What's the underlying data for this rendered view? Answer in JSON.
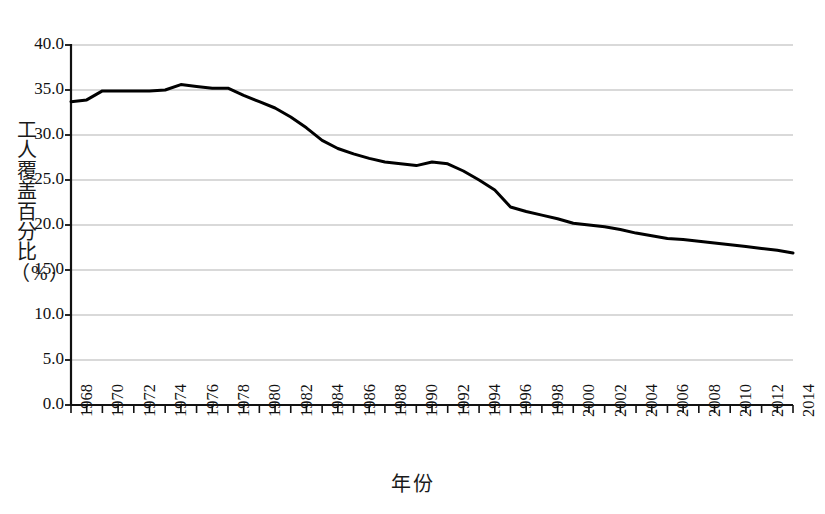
{
  "chart_data": {
    "type": "line",
    "title": "",
    "subtitle": "",
    "xlabel": "年份",
    "ylabel": "工人覆盖百分比（%）",
    "xlim": [
      1968,
      2014
    ],
    "ylim": [
      0.0,
      40.0
    ],
    "grid": true,
    "grid_axis": "y",
    "legend": false,
    "legend_position": "none",
    "line_color": "#000000",
    "line_width": 3,
    "x_tick_step": 2,
    "x_minor_tick_step": 1,
    "y_tick_step": 5,
    "y_tick_labels": [
      "40.0",
      "35.0",
      "30.0",
      "25.0",
      "20.0",
      "15.0",
      "10.0",
      "5.0",
      "0.0"
    ],
    "y_tick_values": [
      40.0,
      35.0,
      30.0,
      25.0,
      20.0,
      15.0,
      10.0,
      5.0,
      0.0
    ],
    "x_tick_labels": [
      "1968",
      "1970",
      "1972",
      "1974",
      "1976",
      "1978",
      "1980",
      "1982",
      "1984",
      "1986",
      "1988",
      "1990",
      "1992",
      "1994",
      "1996",
      "1998",
      "2000",
      "2002",
      "2004",
      "2006",
      "2008",
      "2010",
      "2012",
      "2014"
    ],
    "x_tick_values": [
      1968,
      1970,
      1972,
      1974,
      1976,
      1978,
      1980,
      1982,
      1984,
      1986,
      1988,
      1990,
      1992,
      1994,
      1996,
      1998,
      2000,
      2002,
      2004,
      2006,
      2008,
      2010,
      2012,
      2014
    ],
    "x": [
      1968,
      1969,
      1970,
      1971,
      1972,
      1973,
      1974,
      1975,
      1976,
      1977,
      1978,
      1979,
      1980,
      1981,
      1982,
      1983,
      1984,
      1985,
      1986,
      1987,
      1988,
      1989,
      1990,
      1991,
      1992,
      1993,
      1994,
      1995,
      1996,
      1997,
      1998,
      1999,
      2000,
      2001,
      2002,
      2003,
      2004,
      2005,
      2006,
      2007,
      2008,
      2009,
      2010,
      2011,
      2012,
      2013,
      2014
    ],
    "values": [
      33.7,
      33.9,
      34.9,
      34.9,
      34.9,
      34.9,
      35.0,
      35.6,
      35.4,
      35.2,
      35.2,
      34.4,
      33.7,
      33.0,
      32.0,
      30.8,
      29.4,
      28.5,
      27.9,
      27.4,
      27.0,
      26.8,
      26.6,
      27.0,
      26.8,
      26.0,
      25.0,
      23.9,
      22.0,
      21.5,
      21.1,
      20.7,
      20.2,
      20.0,
      19.8,
      19.5,
      19.1,
      18.8,
      18.5,
      18.4,
      18.2,
      18.0,
      17.8,
      17.6,
      17.4,
      17.2,
      16.9
    ]
  }
}
